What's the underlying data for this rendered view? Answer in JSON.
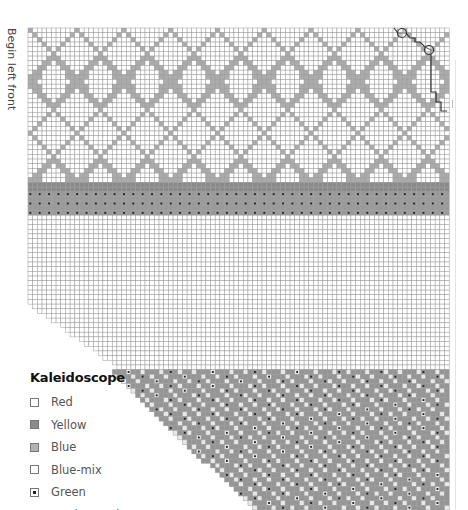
{
  "side_label": "Begin left front",
  "legend": {
    "title": "Kaleidoscope",
    "items": [
      {
        "label": "Red",
        "symbol": "empty-square",
        "fill": "#ffffff"
      },
      {
        "label": "Yellow",
        "symbol": "filled-square",
        "fill": "#8c8c8c"
      },
      {
        "label": "Blue",
        "symbol": "filled-square",
        "fill": "#b3b3b3"
      },
      {
        "label": "Blue-mix",
        "symbol": "empty-square",
        "fill": "#ffffff"
      },
      {
        "label": "Green",
        "symbol": "dot-square",
        "fill": "#ffffff"
      },
      {
        "label": "Border marker",
        "symbol": "circle",
        "fill": "#ffffff"
      }
    ]
  },
  "chart_data": {
    "type": "knitting-chart",
    "title": "Kaleidoscope",
    "grid": {
      "left": 28,
      "top": 28,
      "cell": 4.68,
      "cols": 90,
      "line_color": "#9a9a9a"
    },
    "sections": [
      {
        "name": "diamond-lattice",
        "row_start": 0,
        "row_end": 33,
        "pattern": "diamond",
        "color": "#ababab",
        "period_cols": 10,
        "period_rows": 11
      },
      {
        "name": "solid-band",
        "row_start": 33,
        "row_end": 35,
        "color": "#8a8a8a"
      },
      {
        "name": "green-dot-band",
        "row_start": 35,
        "row_end": 40,
        "color": "#9a9a9a",
        "dot": "#222222"
      },
      {
        "name": "plain-field",
        "row_start": 40,
        "row_end": 73,
        "color": "#ffffff",
        "shaping": {
          "start_row": 58,
          "cols_per_row": 1.4
        }
      },
      {
        "name": "kaleidoscope-field",
        "row_start": 73,
        "row_end": 103,
        "color": "#959595",
        "dot": "#222222",
        "shaping": {
          "start_row": 73,
          "start_col": 18,
          "cols_per_row": 1.05
        }
      }
    ],
    "border_marker": {
      "circles": [
        [
          402,
          33
        ],
        [
          429,
          50
        ]
      ],
      "path": [
        [
          394,
          28
        ],
        [
          398,
          33
        ],
        [
          406,
          33
        ],
        [
          410,
          38
        ],
        [
          415,
          38
        ],
        [
          415,
          42
        ],
        [
          420,
          42
        ],
        [
          425,
          47
        ],
        [
          431,
          50
        ],
        [
          431,
          92
        ],
        [
          436,
          92
        ],
        [
          436,
          102
        ],
        [
          441,
          102
        ],
        [
          441,
          111
        ],
        [
          447,
          111
        ]
      ]
    }
  }
}
